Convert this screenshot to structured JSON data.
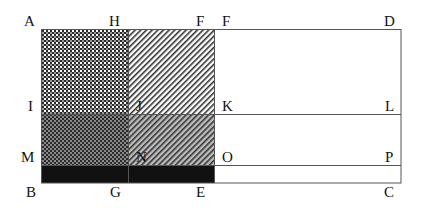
{
  "diagram": {
    "type": "geometric-area-decomposition",
    "points": {
      "A": {
        "label": "A",
        "x": 41,
        "y": 29
      },
      "H": {
        "label": "H",
        "x": 128,
        "y": 29
      },
      "F": {
        "label": "F",
        "x": 214,
        "y": 29
      },
      "D": {
        "label": "D",
        "x": 401,
        "y": 29
      },
      "I": {
        "label": "I",
        "x": 41,
        "y": 114
      },
      "J": {
        "label": "J",
        "x": 128,
        "y": 114
      },
      "K": {
        "label": "K",
        "x": 214,
        "y": 114
      },
      "L": {
        "label": "L",
        "x": 401,
        "y": 114
      },
      "M": {
        "label": "M",
        "x": 41,
        "y": 165
      },
      "N": {
        "label": "N",
        "x": 128,
        "y": 165
      },
      "O": {
        "label": "O",
        "x": 214,
        "y": 165
      },
      "P": {
        "label": "P",
        "x": 401,
        "y": 165
      },
      "B": {
        "label": "B",
        "x": 41,
        "y": 183
      },
      "G": {
        "label": "G",
        "x": 128,
        "y": 183
      },
      "E": {
        "label": "E",
        "x": 214,
        "y": 183
      },
      "C": {
        "label": "C",
        "x": 401,
        "y": 183
      }
    },
    "labels": {
      "A": "A",
      "H": "H",
      "F1": "F",
      "F2": "F",
      "D": "D",
      "I": "I",
      "J": "J",
      "K": "K",
      "L": "L",
      "M": "M",
      "N": "N",
      "O": "O",
      "P": "P",
      "B": "B",
      "G": "G",
      "E": "E",
      "C": "C"
    },
    "regions": [
      {
        "name": "AHJI",
        "fill": "crosshatch-dark"
      },
      {
        "name": "HFKJ",
        "fill": "diagonal-light"
      },
      {
        "name": "IJNM",
        "fill": "crosshatch-darker"
      },
      {
        "name": "JKON",
        "fill": "diagonal-gray"
      },
      {
        "name": "MOEB",
        "fill": "solid-black"
      },
      {
        "name": "FDCE",
        "fill": "white"
      }
    ],
    "colors": {
      "line": "#555555",
      "black_strip": "#111111",
      "gray_bg": "#b8b8b8",
      "hatch": "#333333"
    }
  }
}
